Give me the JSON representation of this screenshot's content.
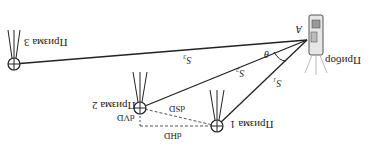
{
  "diagram": {
    "orientation": "rotated 180 degrees",
    "instrument": {
      "label": "Прибор",
      "point": "A"
    },
    "prisms": [
      {
        "label": "Призма 1"
      },
      {
        "label": "Призма 2"
      },
      {
        "label": "Призма 3"
      }
    ],
    "distances": {
      "s1": "S₁",
      "s2": "S₂",
      "s3": "S₃"
    },
    "angle": "θ",
    "measurements": {
      "dSD": "dSD",
      "dHD": "dHD",
      "dVD": "dVD"
    },
    "colors": {
      "line": "#222222",
      "dashed": "#555555"
    }
  }
}
